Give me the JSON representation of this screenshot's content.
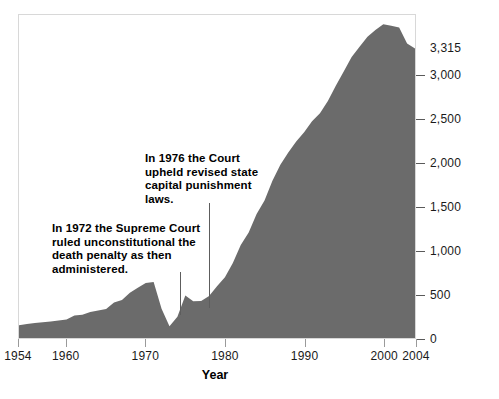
{
  "chart_data": {
    "type": "area",
    "title": "",
    "xlabel": "Year",
    "ylabel": "",
    "xlim": [
      1954,
      2004
    ],
    "ylim": [
      0,
      3700
    ],
    "grid": false,
    "legend": "none",
    "series_color": "#6b6b6b",
    "x_ticks": [
      "1954",
      "1960",
      "1970",
      "1980",
      "1990",
      "2000",
      "2004"
    ],
    "x_tick_values": [
      1954,
      1960,
      1970,
      1980,
      1990,
      2000,
      2004
    ],
    "y_ticks": [
      "0",
      "500",
      "1,000",
      "1,500",
      "2,000",
      "2,500",
      "3,000"
    ],
    "y_tick_values": [
      0,
      500,
      1000,
      1500,
      2000,
      2500,
      3000
    ],
    "y_callout_label": "3,315",
    "y_callout_value": 3315,
    "x": [
      1954,
      1955,
      1956,
      1957,
      1958,
      1959,
      1960,
      1961,
      1962,
      1963,
      1964,
      1965,
      1966,
      1967,
      1968,
      1969,
      1970,
      1971,
      1972,
      1973,
      1974,
      1975,
      1976,
      1977,
      1978,
      1979,
      1980,
      1981,
      1982,
      1983,
      1984,
      1985,
      1986,
      1987,
      1988,
      1989,
      1990,
      1991,
      1992,
      1993,
      1994,
      1995,
      1996,
      1997,
      1998,
      1999,
      2000,
      2001,
      2002,
      2003,
      2004
    ],
    "values": [
      147,
      160,
      171,
      180,
      190,
      200,
      212,
      257,
      267,
      297,
      315,
      331,
      406,
      435,
      517,
      575,
      631,
      642,
      334,
      134,
      244,
      488,
      420,
      423,
      482,
      593,
      697,
      860,
      1066,
      1209,
      1420,
      1575,
      1800,
      1984,
      2124,
      2250,
      2356,
      2482,
      2575,
      2716,
      2890,
      3054,
      3219,
      3335,
      3452,
      3527,
      3593,
      3577,
      3557,
      3374,
      3315
    ],
    "annotations": [
      {
        "id": "1972",
        "text": "In 1972 the Supreme Court ruled unconstitutional the death penalty as then administered.",
        "points_to_year": 1972
      },
      {
        "id": "1976",
        "text": "In 1976 the Court upheld revised state capital punishment laws.",
        "points_to_year": 1976
      }
    ]
  },
  "axis": {
    "x_title": "Year"
  },
  "annotations": {
    "a1972": "In 1972 the Supreme Court ruled unconstitutional the death penalty as then administered.",
    "a1976": "In 1976 the Court upheld revised state capital punishment laws."
  },
  "y_labels": {
    "t0": "0",
    "t500": "500",
    "t1000": "1,000",
    "t1500": "1,500",
    "t2000": "2,000",
    "t2500": "2,500",
    "t3000": "3,000",
    "callout": "3,315"
  },
  "x_labels": {
    "t1954": "1954",
    "t1960": "1960",
    "t1970": "1970",
    "t1980": "1980",
    "t1990": "1990",
    "t2000": "2000",
    "t2004": "2004"
  }
}
